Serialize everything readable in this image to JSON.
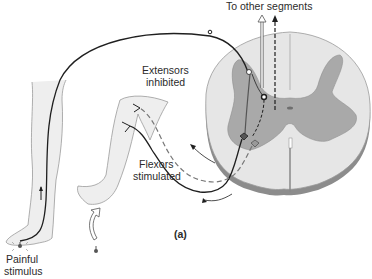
{
  "diagram": {
    "type": "flexor-withdrawal-reflex",
    "panel_label": "(a)",
    "labels": {
      "to_other_segments": "To other segments",
      "extensors_line1": "Extensors",
      "extensors_line2": "inhibited",
      "flexors_line1": "Flexors",
      "flexors_line2": "stimulated",
      "stimulus_line1": "Painful",
      "stimulus_line2": "stimulus"
    },
    "colors": {
      "white_matter": "#e6e6e6",
      "gray_matter": "#a9a9a9",
      "cord_edge": "#8c8c8c",
      "skin": "#eeeeee",
      "skin_outline": "#9a9a9a",
      "nerve": "#1f1f1f",
      "inhibited_path": "#777777"
    },
    "parts": [
      "stimulated leg",
      "withdrawing leg",
      "sensory neuron",
      "interneurons",
      "motor neurons to flexors",
      "inhibited motor neurons to extensors",
      "spinal cord cross-section",
      "ascending tracts"
    ]
  }
}
